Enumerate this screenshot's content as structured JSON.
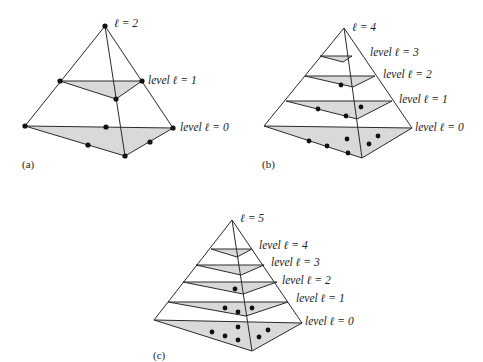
{
  "figure": {
    "panels": [
      {
        "id": "a",
        "caption": "(a)",
        "apex_label": "ℓ = 2",
        "level_labels": [
          "level ℓ = 1",
          "level ℓ = 0"
        ]
      },
      {
        "id": "b",
        "caption": "(b)",
        "apex_label": "ℓ = 4",
        "level_labels": [
          "level ℓ = 3",
          "level ℓ = 2",
          "level ℓ = 1",
          "level ℓ = 0"
        ]
      },
      {
        "id": "c",
        "caption": "(c)",
        "apex_label": "ℓ = 5",
        "level_labels": [
          "level ℓ = 4",
          "level ℓ = 3",
          "level ℓ = 2",
          "level ℓ = 1",
          "level ℓ = 0"
        ]
      }
    ]
  }
}
